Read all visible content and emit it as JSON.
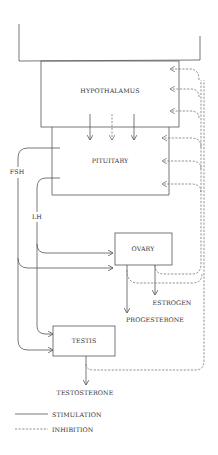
{
  "diagram": {
    "type": "hormone feedback flowchart",
    "nodes": {
      "hypothalamus": "HYPOTHALAMUS",
      "pituitary": "PITUITARY",
      "ovary": "OVARY",
      "testis": "TESTIS"
    },
    "edge_labels": {
      "fsh": "FSH",
      "lh": "LH"
    },
    "outputs": {
      "estrogen": "ESTROGEN",
      "progesterone": "PROGESTERONE",
      "testosterone": "TESTOSTERONE"
    },
    "legend": {
      "stimulation": "STIMULATION",
      "inhibition": "INHIBITION"
    },
    "colors": {
      "line": "#555555",
      "dashed": "#777777",
      "text": "#333333"
    }
  }
}
